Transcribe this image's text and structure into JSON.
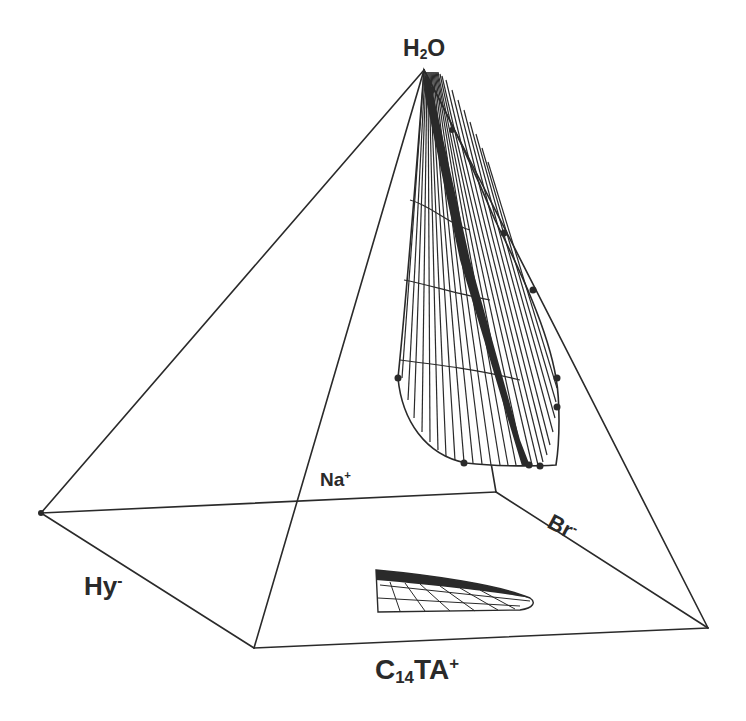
{
  "diagram": {
    "type": "quaternary phase diagram (square pyramid)",
    "vertices": {
      "apex": {
        "label": "H",
        "sub": "2",
        "after": "O"
      },
      "back": {
        "label": "Na",
        "sup": "+"
      },
      "right": {
        "label": "Br",
        "sup": "-"
      },
      "left": {
        "label": "Hy",
        "sup": "-"
      },
      "front": {
        "label": "C",
        "sub": "14",
        "after": "TA",
        "sup": "+"
      }
    },
    "colors": {
      "line": "#2a2a2a",
      "background": "#ffffff"
    },
    "regions": [
      {
        "name": "single-phase lamellar region (3D surface)"
      },
      {
        "name": "projection onto base plane"
      }
    ]
  }
}
